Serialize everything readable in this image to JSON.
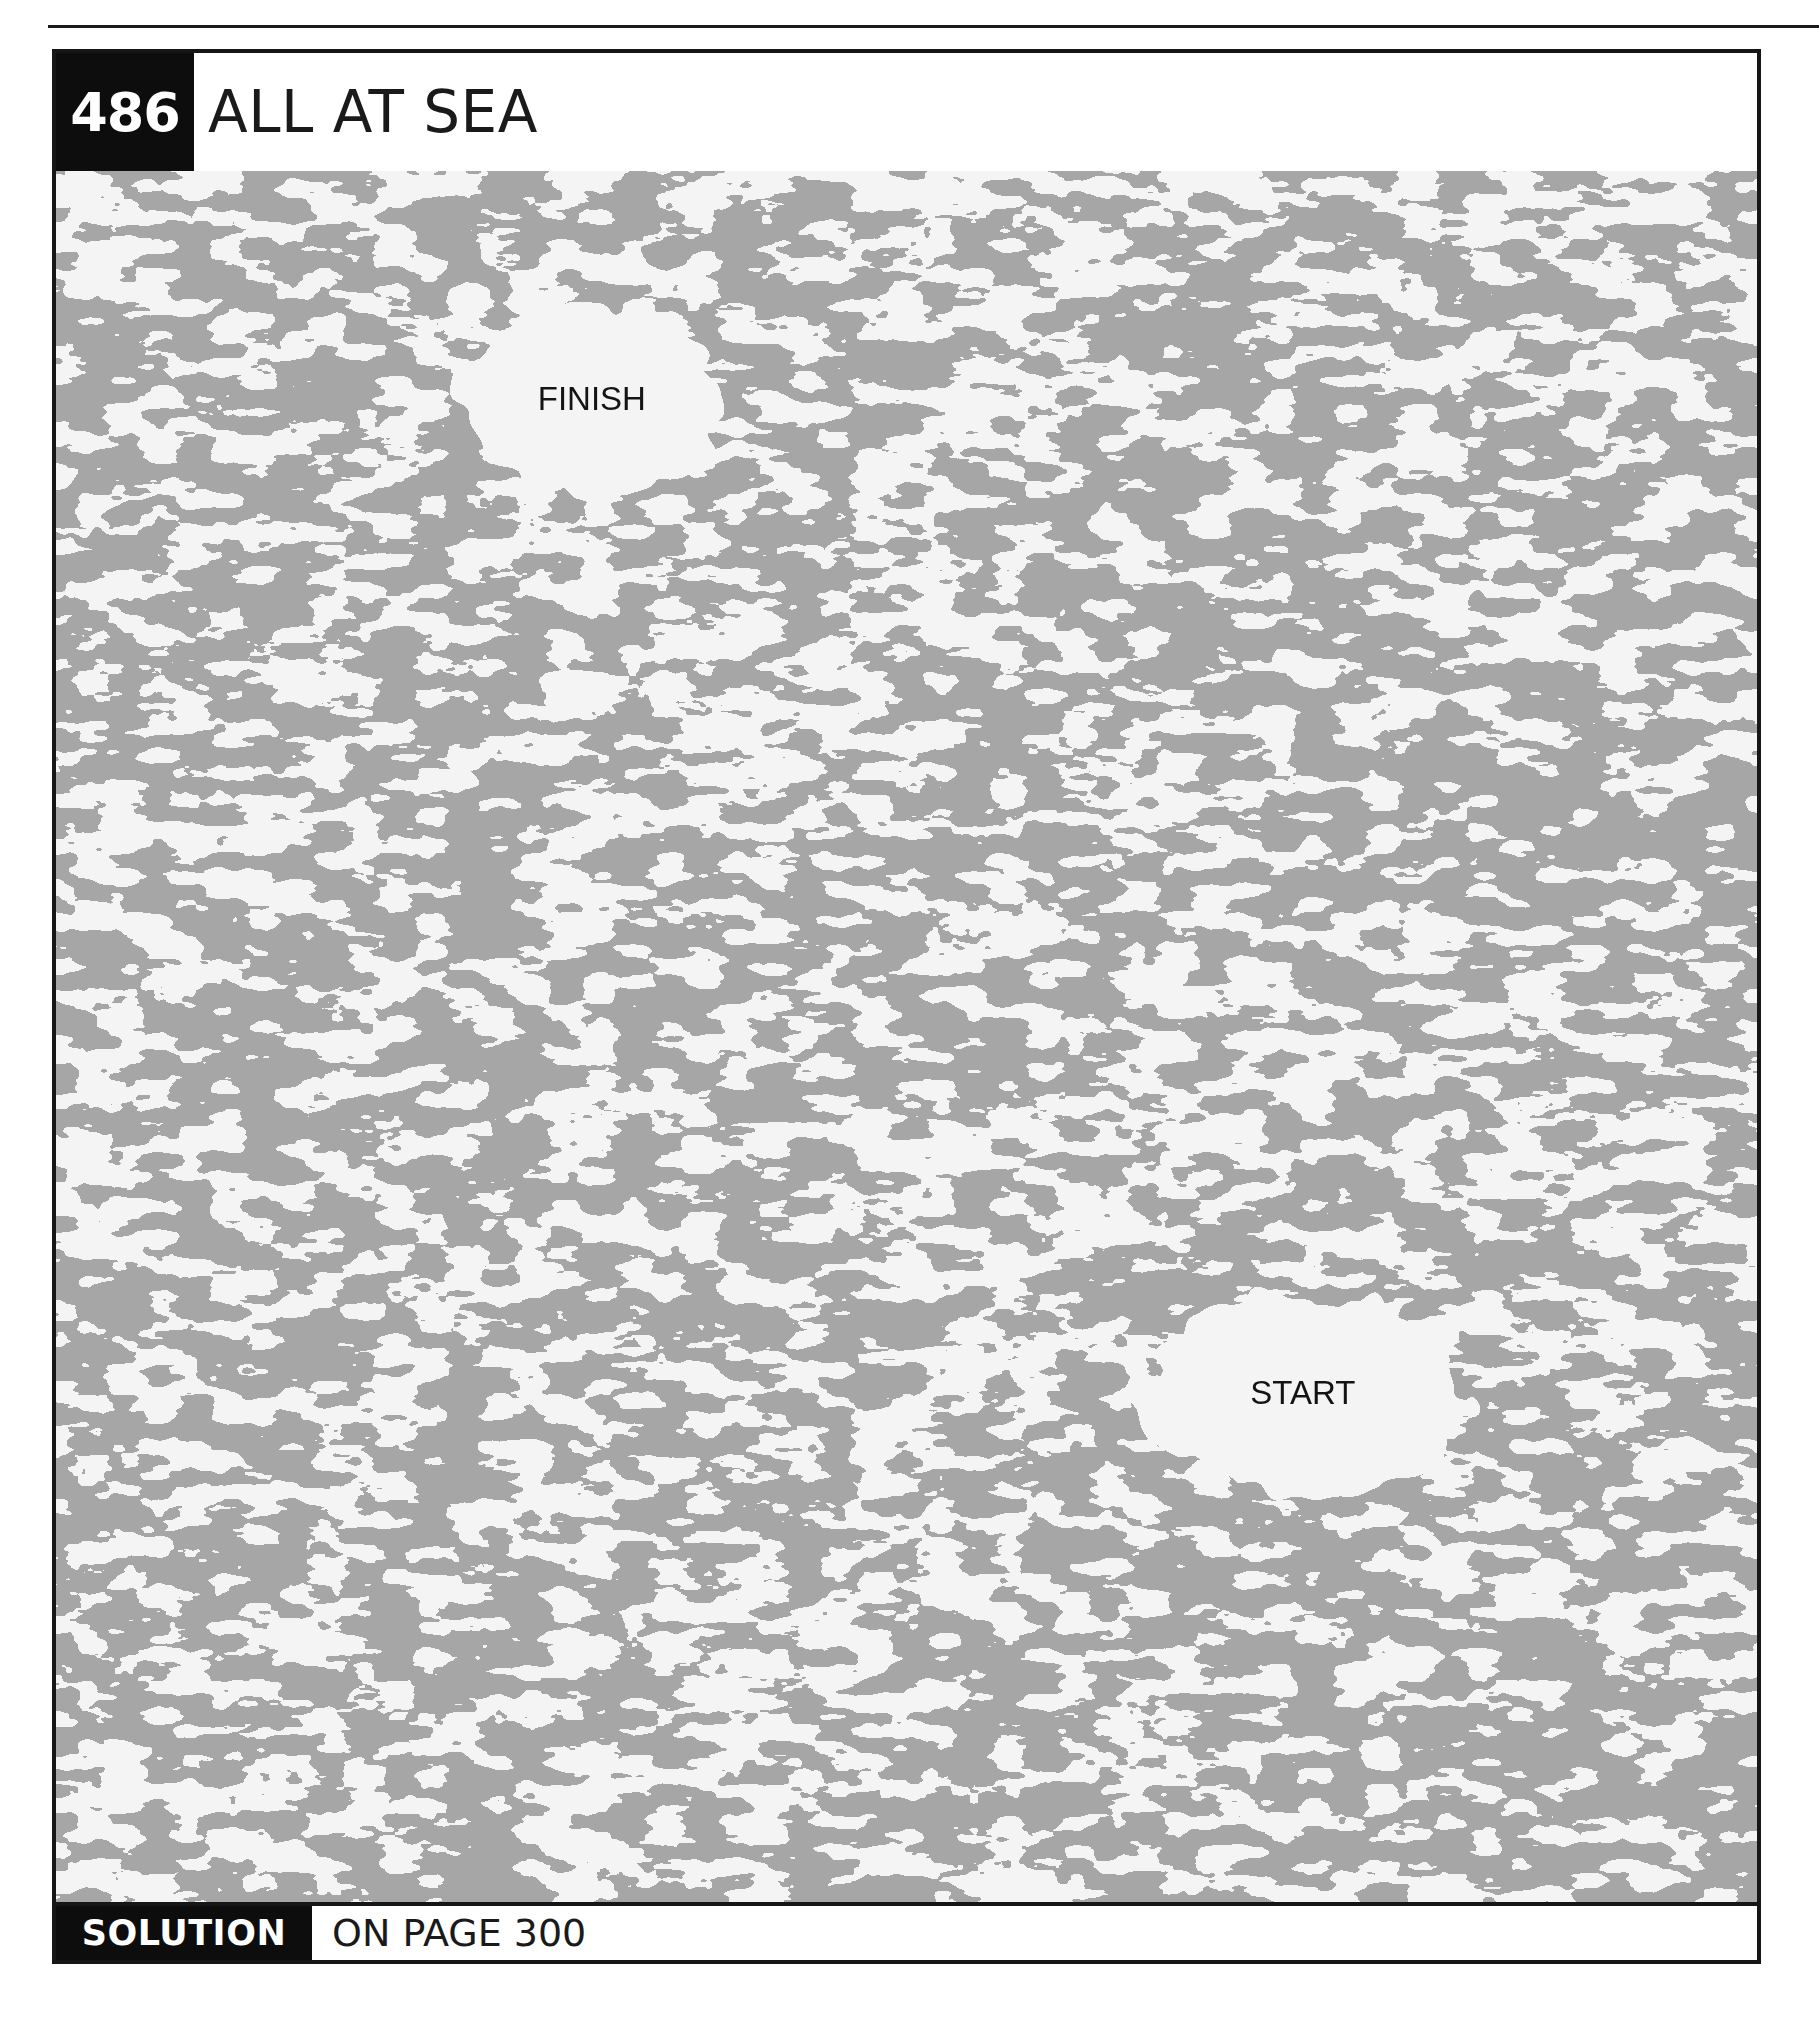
{
  "puzzle": {
    "number": "486",
    "title": "ALL AT SEA"
  },
  "maze": {
    "sea_color": "#f4f4f4",
    "land_color": "#a6a6a6",
    "labels": [
      {
        "id": "finish",
        "text": "FINISH",
        "x_pct": 31.5,
        "y_pct": 13.2,
        "clearing_rx": 135,
        "clearing_ry": 95
      },
      {
        "id": "start",
        "text": "START",
        "x_pct": 73.3,
        "y_pct": 70.6,
        "clearing_rx": 165,
        "clearing_ry": 100
      }
    ]
  },
  "footer": {
    "solution_label": "SOLUTION",
    "solution_ref": "ON PAGE 300"
  }
}
